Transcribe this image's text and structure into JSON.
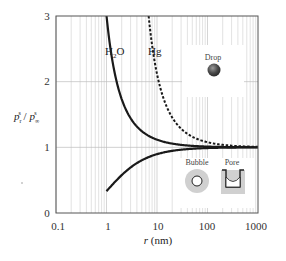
{
  "chart_data": {
    "type": "line",
    "title": "",
    "xlabel": "r (nm)",
    "ylabel": "p_r^s / p_∞^s",
    "xscale": "log",
    "xlim": [
      0.1,
      1000
    ],
    "ylim": [
      0,
      3
    ],
    "x_ticks": [
      "0.1",
      "1",
      "10",
      "100",
      "1000"
    ],
    "y_ticks": [
      "0",
      "1",
      "2",
      "3"
    ],
    "grid": true,
    "series": [
      {
        "name": "H2O (drop)",
        "style": "solid",
        "kelvin_length_nm": 1.1,
        "sign": 1,
        "x": [
          1.0,
          1.5,
          2,
          3,
          5,
          10,
          20,
          50,
          100,
          1000
        ],
        "values": [
          3.0,
          2.08,
          1.73,
          1.44,
          1.25,
          1.12,
          1.06,
          1.02,
          1.01,
          1.0
        ]
      },
      {
        "name": "Hg (drop)",
        "style": "dashed",
        "kelvin_length_nm": 7.5,
        "sign": 1,
        "x": [
          6.8,
          8,
          10,
          15,
          20,
          30,
          50,
          100,
          200,
          1000
        ],
        "values": [
          3.0,
          2.55,
          2.12,
          1.65,
          1.45,
          1.28,
          1.16,
          1.08,
          1.04,
          1.0
        ]
      },
      {
        "name": "H2O (bubble/pore)",
        "style": "solid",
        "kelvin_length_nm": 1.1,
        "sign": -1,
        "x": [
          1.0,
          2,
          3,
          5,
          10,
          20,
          50,
          100,
          1000
        ],
        "values": [
          0.33,
          0.58,
          0.69,
          0.8,
          0.9,
          0.95,
          0.98,
          0.99,
          1.0
        ]
      }
    ],
    "annotations": [
      "H2O",
      "Hg",
      "Drop",
      "Bubble",
      "Pore"
    ]
  },
  "labels": {
    "h2o": "H",
    "h2o_sub": "2",
    "h2o_o": "O",
    "hg": "Hg",
    "drop": "Drop",
    "bubble": "Bubble",
    "pore": "Pore",
    "xlabel_r": "r",
    "xlabel_unit": " (nm)",
    "ylabel_p1": "p",
    "ylabel_sub1": "r",
    "ylabel_sup1": "s",
    "ylabel_slash": " / ",
    "ylabel_p2": "p",
    "ylabel_sub2": "∞",
    "ylabel_sup2": "s"
  },
  "ticks": {
    "x": [
      "0.1",
      "1",
      "10",
      "100",
      "1000"
    ],
    "y": [
      "0",
      "1",
      "2",
      "3"
    ]
  },
  "colors": {
    "curve": "#1a1a1a",
    "grid": "#cfcfcf",
    "axis": "#555555",
    "drop": "#4a4a4a",
    "inset_bg": "#cfcfcf"
  }
}
